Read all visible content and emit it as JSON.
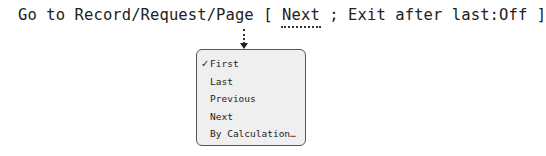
{
  "script_step": {
    "prefix": "Go to Record/Request/Page [ ",
    "selected_option": "Next",
    "suffix": " ; Exit after last:",
    "exit_after_last_value": "Off",
    "closing": " ]"
  },
  "popup_menu": {
    "items": [
      {
        "label": "First",
        "checked": true,
        "check_glyph": "✓"
      },
      {
        "label": "Last",
        "checked": false
      },
      {
        "label": "Previous",
        "checked": false
      },
      {
        "label": "Next",
        "checked": false
      },
      {
        "label": "By Calculation…",
        "checked": false
      }
    ]
  },
  "colors": {
    "text": "#222222",
    "menu_background": "#efefef",
    "menu_border": "#555555",
    "connector": "#333333"
  }
}
